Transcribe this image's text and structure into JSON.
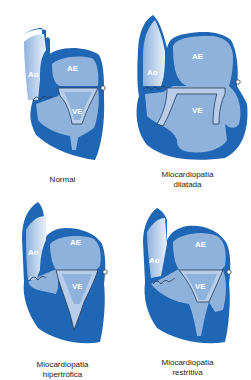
{
  "colors": {
    "wall": "#1f66b4",
    "chamber": "#8fb2dd",
    "chamber_light": "#b7cde9",
    "outline": "#2a3b52",
    "background": "#ffffff"
  },
  "panels": [
    {
      "id": "normal",
      "caption_line1": "Normal",
      "caption_line2": "",
      "labels": {
        "aorta": "Ao",
        "left_atrium": "AE",
        "left_ventricle": "VE"
      }
    },
    {
      "id": "dilated",
      "caption_line1": "Miocardiopatia",
      "caption_line2": "dilatada",
      "labels": {
        "aorta": "Ao",
        "left_atrium": "AE",
        "left_ventricle": "VE"
      }
    },
    {
      "id": "hypertrophic",
      "caption_line1": "Miocardiopatia",
      "caption_line2": "hipertrófica",
      "labels": {
        "aorta": "Ao",
        "left_atrium": "AE",
        "left_ventricle": "VE"
      }
    },
    {
      "id": "restrictive",
      "caption_line1": "Miocardiopatia",
      "caption_line2": "restritiva",
      "labels": {
        "aorta": "Ao",
        "left_atrium": "AE",
        "left_ventricle": "VE"
      }
    }
  ]
}
